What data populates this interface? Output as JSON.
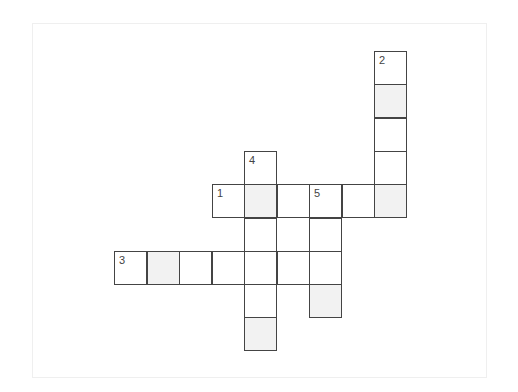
{
  "puzzle": {
    "type": "crossword",
    "grid": {
      "origin_x": 114,
      "origin_y": 51,
      "cell_w": 32.5,
      "cell_h": 33.3,
      "cells": [
        {
          "r": 0,
          "c": 8,
          "num": "2",
          "shaded": false
        },
        {
          "r": 1,
          "c": 8,
          "shaded": true
        },
        {
          "r": 2,
          "c": 8,
          "shaded": false
        },
        {
          "r": 3,
          "c": 8,
          "shaded": false
        },
        {
          "r": 4,
          "c": 8,
          "shaded": true
        },
        {
          "r": 3,
          "c": 4,
          "num": "4",
          "shaded": false
        },
        {
          "r": 4,
          "c": 3,
          "num": "1",
          "shaded": false
        },
        {
          "r": 4,
          "c": 4,
          "shaded": true
        },
        {
          "r": 4,
          "c": 5,
          "shaded": false
        },
        {
          "r": 4,
          "c": 6,
          "num": "5",
          "shaded": false
        },
        {
          "r": 4,
          "c": 7,
          "shaded": false
        },
        {
          "r": 5,
          "c": 4,
          "shaded": false
        },
        {
          "r": 5,
          "c": 6,
          "shaded": false
        },
        {
          "r": 6,
          "c": 0,
          "num": "3",
          "shaded": false
        },
        {
          "r": 6,
          "c": 1,
          "shaded": true
        },
        {
          "r": 6,
          "c": 2,
          "shaded": false
        },
        {
          "r": 6,
          "c": 3,
          "shaded": false
        },
        {
          "r": 6,
          "c": 4,
          "shaded": false
        },
        {
          "r": 6,
          "c": 5,
          "shaded": false
        },
        {
          "r": 6,
          "c": 6,
          "shaded": false
        },
        {
          "r": 7,
          "c": 4,
          "shaded": false
        },
        {
          "r": 7,
          "c": 6,
          "shaded": true
        },
        {
          "r": 8,
          "c": 4,
          "shaded": true
        }
      ]
    },
    "entries": [
      {
        "number": "1",
        "direction": "across",
        "length": 6
      },
      {
        "number": "2",
        "direction": "down",
        "length": 5
      },
      {
        "number": "3",
        "direction": "across",
        "length": 7
      },
      {
        "number": "4",
        "direction": "down",
        "length": 6
      },
      {
        "number": "5",
        "direction": "down",
        "length": 4
      }
    ],
    "colors": {
      "border": "#444444",
      "shaded": "#f2f2f2",
      "background": "#ffffff"
    }
  }
}
